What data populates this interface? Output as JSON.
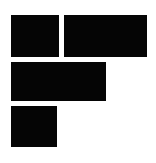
{
  "figure": {
    "title": "Black Block Composition",
    "description": "Four solid black rectangles arranged in an F-like stepped formation on a white background",
    "background_color": "#ffffff",
    "fill_color": "#050505",
    "canvas": {
      "width": 156,
      "height": 163,
      "units": "px"
    }
  },
  "blocks": [
    {
      "id": "top-left",
      "label": "Top left block",
      "x": 11,
      "y": 15,
      "width": 48,
      "height": 42,
      "color": "#050505"
    },
    {
      "id": "top-right",
      "label": "Top right block",
      "x": 64,
      "y": 15,
      "width": 83,
      "height": 42,
      "color": "#050505"
    },
    {
      "id": "middle",
      "label": "Middle wide block",
      "x": 11,
      "y": 62,
      "width": 95,
      "height": 39,
      "color": "#050505"
    },
    {
      "id": "bottom-left",
      "label": "Bottom left block",
      "x": 11,
      "y": 106,
      "width": 46,
      "height": 41,
      "color": "#050505"
    }
  ]
}
